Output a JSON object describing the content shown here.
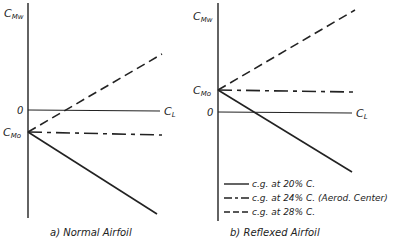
{
  "panels": [
    {
      "id": "a",
      "caption": "a) Normal Airfoil",
      "y_axis_label": "C",
      "y_axis_sub": "Mw",
      "x_axis_label": "C",
      "x_axis_sub": "L",
      "zero_label": "0",
      "intercept_label": "C",
      "intercept_sub": "Mo",
      "intercept_position": "below zero (negative)"
    },
    {
      "id": "b",
      "caption": "b) Reflexed Airfoil",
      "y_axis_label": "C",
      "y_axis_sub": "Mw",
      "x_axis_label": "C",
      "x_axis_sub": "L",
      "zero_label": "0",
      "intercept_label": "C",
      "intercept_sub": "Mo",
      "intercept_position": "above zero (positive)"
    }
  ],
  "legend": [
    {
      "style": "solid",
      "label": "c.g. at 20% C."
    },
    {
      "style": "dash-dot",
      "label": "c.g. at 24% C. (Aerod. Center)"
    },
    {
      "style": "dashed",
      "label": "c.g. at 28% C."
    }
  ],
  "line_color": "#222222"
}
